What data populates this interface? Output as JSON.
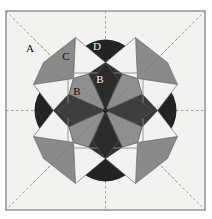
{
  "figure": {
    "canvas": {
      "width": 212,
      "height": 219
    },
    "frame": {
      "x": 6,
      "y": 11,
      "width": 199,
      "height": 199,
      "fill": "#f2f2f0",
      "stroke": "#9a9a9a",
      "stroke_width": 1.6
    },
    "center": {
      "cx": 105.5,
      "cy": 110.5
    },
    "colors": {
      "background": "#f2f2f0",
      "dark": "#232323",
      "mid_gray": "#8a8a8a",
      "light": "#f2f2f0",
      "construction_line": "#7a7a7a",
      "outline": "#6e6e6e",
      "label_dark": "#111111",
      "label_light": "#f2f2f2"
    },
    "construction": {
      "diagonals_visible": true,
      "axes_visible": true,
      "inner_square_visible": true,
      "inner_square": {
        "x": 68,
        "y": 73,
        "width": 75,
        "height": 75
      },
      "dashed": true
    },
    "labels": [
      {
        "id": "A",
        "text": "A",
        "x": 30,
        "y": 52,
        "tone": "dark",
        "desc": "background-field-label"
      },
      {
        "id": "C",
        "text": "C",
        "x": 66,
        "y": 60,
        "tone": "dark",
        "desc": "outer-kite-label"
      },
      {
        "id": "D",
        "text": "D",
        "x": 97,
        "y": 50,
        "tone": "light",
        "desc": "half-disc-label"
      },
      {
        "id": "B1",
        "text": "B",
        "x": 100,
        "y": 83,
        "tone": "light",
        "desc": "inner-kite-label"
      },
      {
        "id": "B2",
        "text": "B",
        "x": 77,
        "y": 95,
        "tone": "dark",
        "desc": "inner-kite-label-2"
      }
    ],
    "elements": {
      "half_discs": {
        "count": 4,
        "radius": 35,
        "distance": 65,
        "fill": "#232323",
        "orientation": "flat-side-inward",
        "angles": [
          0,
          90,
          180,
          270
        ]
      },
      "outer_star_points": {
        "count": 8,
        "fill_alternating": [
          "#8a8a8a",
          "#f2f2f0"
        ],
        "shape": "rhombus-kite"
      },
      "inner_rosette_petals": {
        "count": 8,
        "fill_alternating": [
          "#4a4a4a",
          "#8a8a8a"
        ],
        "shape": "kite"
      },
      "mid_ring_kites": {
        "count": 8,
        "fill_alternating": [
          "#f2f2f0",
          "#8a8a8a"
        ]
      }
    },
    "legend": {
      "A": "background field",
      "B": "inner rosette kite",
      "C": "outer star rhombus",
      "D": "half disc"
    }
  }
}
